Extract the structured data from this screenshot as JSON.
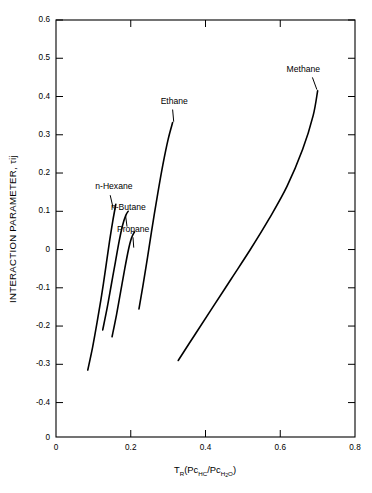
{
  "chart_data": {
    "type": "line",
    "title": "",
    "xlabel": "T_R(Pc_HC/Pc_H2O)",
    "xlabel_parts": {
      "t": "T",
      "t_sub": "R",
      "open": "(Pc",
      "hc_sub": "HC",
      "slash": "/Pc",
      "h_sub": "H",
      "two_sub": "2",
      "o_sub": "O",
      "close": ")"
    },
    "ylabel": "INTERACTION PARAMETER, τij",
    "ylabel_main": "INTERACTION PARAMETER, ",
    "ylabel_tau": "τ",
    "ylabel_ij": "ij",
    "xlim": [
      0,
      0.8
    ],
    "ylim": [
      -0.49,
      0.6
    ],
    "grid": false,
    "legend": "inline-labels",
    "xticks": [
      0,
      0.2,
      0.4,
      0.6,
      0.8
    ],
    "xticklabels": [
      "0",
      "0.2",
      "0.4",
      "0.6",
      "0.8"
    ],
    "yticks": [
      0.6,
      0.5,
      0.4,
      0.3,
      0.2,
      0.1,
      0,
      -0.1,
      -0.2,
      -0.3,
      -0.4
    ],
    "yticklabels": [
      "0.6",
      "0.5",
      "0.4",
      "0.3",
      "0.2",
      "0.1",
      "0",
      "-0.1",
      "-0.2",
      "-0.3",
      "-0.4"
    ],
    "y_origin_label": "0",
    "line_color": "#000000",
    "series": [
      {
        "name": "n-Hexane",
        "label": "n-Hexane",
        "label_x": 0.105,
        "label_y": 0.157,
        "leader_from": [
          0.145,
          0.142
        ],
        "leader_to": [
          0.153,
          0.108
        ],
        "x": [
          0.085,
          0.098,
          0.11,
          0.122,
          0.133,
          0.143,
          0.152,
          0.16
        ],
        "y": [
          -0.315,
          -0.255,
          -0.19,
          -0.12,
          -0.048,
          0.02,
          0.075,
          0.118
        ]
      },
      {
        "name": "n-Butane",
        "label": "n-Butane",
        "label_x": 0.147,
        "label_y": 0.104,
        "leader_from": [
          0.186,
          0.09
        ],
        "leader_to": [
          0.19,
          0.06
        ],
        "x": [
          0.125,
          0.137,
          0.148,
          0.159,
          0.169,
          0.178,
          0.187,
          0.193
        ],
        "y": [
          -0.21,
          -0.152,
          -0.092,
          -0.032,
          0.022,
          0.063,
          0.09,
          0.1
        ]
      },
      {
        "name": "Propane",
        "label": "Propane",
        "label_x": 0.163,
        "label_y": 0.045,
        "leader_from": [
          0.206,
          0.032
        ],
        "leader_to": [
          0.208,
          0.005
        ],
        "x": [
          0.15,
          0.162,
          0.173,
          0.184,
          0.194,
          0.202,
          0.21
        ],
        "y": [
          -0.228,
          -0.17,
          -0.11,
          -0.05,
          0.0,
          0.03,
          0.046
        ]
      },
      {
        "name": "Ethane",
        "label": "Ethane",
        "label_x": 0.28,
        "label_y": 0.381,
        "leader_from": [
          0.312,
          0.366
        ],
        "leader_to": [
          0.315,
          0.334
        ],
        "x": [
          0.222,
          0.232,
          0.245,
          0.258,
          0.272,
          0.286,
          0.3,
          0.312
        ],
        "y": [
          -0.155,
          -0.098,
          -0.02,
          0.062,
          0.145,
          0.222,
          0.288,
          0.332
        ]
      },
      {
        "name": "Methane",
        "label": "Methane",
        "label_x": 0.617,
        "label_y": 0.464,
        "leader_from": [
          0.686,
          0.45
        ],
        "leader_to": [
          0.698,
          0.418
        ],
        "x": [
          0.327,
          0.372,
          0.42,
          0.47,
          0.52,
          0.57,
          0.618,
          0.66,
          0.688,
          0.7
        ],
        "y": [
          -0.29,
          -0.222,
          -0.15,
          -0.075,
          0.0,
          0.08,
          0.165,
          0.262,
          0.35,
          0.415
        ]
      }
    ]
  }
}
